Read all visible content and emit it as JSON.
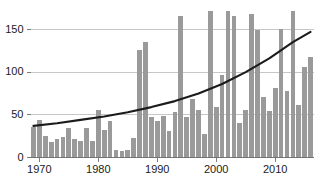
{
  "chart_data": {
    "type": "bar",
    "title": "",
    "subtitle": "",
    "xlabel": "",
    "ylabel": "",
    "xlim": [
      1968.5,
      2016.5
    ],
    "ylim": [
      0,
      175
    ],
    "grid": true,
    "legend": false,
    "legend_position": "none",
    "bar_color": "#9a9a9a",
    "trend_color": "#1b1b1b",
    "grid_color": "#b9b9b9",
    "axis_color": "#6e6e6e",
    "ytick_values": [
      0,
      50,
      100,
      150
    ],
    "ytick_labels": [
      "0",
      "50",
      "100",
      "150"
    ],
    "xtick_values": [
      1970,
      1980,
      1990,
      2000,
      2010
    ],
    "xtick_labels": [
      "1970",
      "1980",
      "1990",
      "2000",
      "2010"
    ],
    "categories": [
      1969,
      1970,
      1971,
      1972,
      1973,
      1974,
      1975,
      1976,
      1977,
      1978,
      1979,
      1980,
      1981,
      1982,
      1983,
      1984,
      1985,
      1986,
      1987,
      1988,
      1989,
      1990,
      1991,
      1992,
      1993,
      1994,
      1995,
      1996,
      1997,
      1998,
      1999,
      2000,
      2001,
      2002,
      2003,
      2004,
      2005,
      2006,
      2007,
      2008,
      2009,
      2010,
      2011,
      2012,
      2013,
      2014,
      2015,
      2016
    ],
    "values": [
      36,
      44,
      25,
      18,
      22,
      24,
      34,
      22,
      19,
      34,
      19,
      56,
      32,
      43,
      9,
      8,
      9,
      23,
      126,
      135,
      47,
      43,
      49,
      31,
      53,
      166,
      47,
      69,
      56,
      28,
      172,
      59,
      96,
      171,
      166,
      40,
      56,
      168,
      149,
      71,
      55,
      81,
      150,
      78,
      171,
      62,
      106,
      118
    ],
    "series": [
      {
        "name": "annual values",
        "type": "bar",
        "values": [
          36,
          44,
          25,
          18,
          22,
          24,
          34,
          22,
          19,
          34,
          19,
          56,
          32,
          43,
          9,
          8,
          9,
          23,
          126,
          135,
          47,
          43,
          49,
          31,
          53,
          166,
          47,
          69,
          56,
          28,
          172,
          59,
          96,
          171,
          166,
          40,
          56,
          168,
          149,
          71,
          55,
          81,
          150,
          78,
          171,
          62,
          106,
          118
        ]
      },
      {
        "name": "trend",
        "type": "line",
        "x": [
          1969,
          1973,
          1977,
          1981,
          1985,
          1989,
          1993,
          1997,
          2001,
          2005,
          2009,
          2013,
          2016
        ],
        "values": [
          37,
          40,
          44,
          48,
          53,
          59,
          66,
          75,
          86,
          100,
          116,
          135,
          147
        ]
      }
    ]
  }
}
